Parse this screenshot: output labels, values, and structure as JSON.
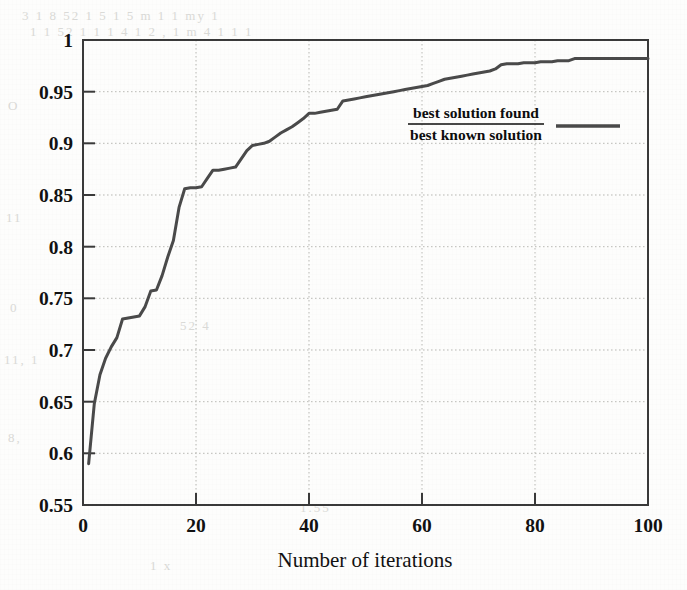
{
  "chart_data": {
    "type": "line",
    "title": "",
    "subtitle": "",
    "xlabel": "Number of iterations",
    "ylabel": "",
    "xlim": [
      0,
      100
    ],
    "ylim": [
      0.55,
      1
    ],
    "grid": true,
    "grid_style": "dotted",
    "legend_position": "inside-center-right",
    "xticks": [
      "0",
      "20",
      "40",
      "60",
      "80",
      "100"
    ],
    "xtick_values": [
      0,
      20,
      40,
      60,
      80,
      100
    ],
    "yticks": [
      "0.55",
      "0.6",
      "0.65",
      "0.7",
      "0.75",
      "0.8",
      "0.85",
      "0.9",
      "0.95",
      "1"
    ],
    "ytick_values": [
      0.55,
      0.6,
      0.65,
      0.7,
      0.75,
      0.8,
      0.85,
      0.9,
      0.95,
      1
    ],
    "series": [
      {
        "name": "best solution found / best known solution",
        "legend_numerator": "best solution found",
        "legend_denominator": "best known solution",
        "color": "#4a4a4a",
        "line_width": 3,
        "x": [
          1,
          2,
          3,
          4,
          5,
          6,
          7,
          8,
          9,
          10,
          11,
          12,
          13,
          14,
          15,
          16,
          17,
          18,
          19,
          20,
          21,
          22,
          23,
          24,
          25,
          26,
          27,
          28,
          29,
          30,
          31,
          32,
          33,
          34,
          35,
          36,
          37,
          38,
          39,
          40,
          41,
          42,
          43,
          44,
          45,
          46,
          47,
          48,
          49,
          50,
          51,
          52,
          53,
          54,
          55,
          56,
          57,
          58,
          59,
          60,
          61,
          62,
          63,
          64,
          65,
          66,
          67,
          68,
          69,
          70,
          71,
          72,
          73,
          74,
          75,
          76,
          77,
          78,
          79,
          80,
          81,
          82,
          83,
          84,
          85,
          86,
          87,
          88,
          89,
          90,
          91,
          92,
          93,
          94,
          95,
          96,
          97,
          98,
          99,
          100
        ],
        "y": [
          0.59,
          0.648,
          0.676,
          0.692,
          0.703,
          0.712,
          0.73,
          0.731,
          0.732,
          0.733,
          0.742,
          0.757,
          0.758,
          0.772,
          0.79,
          0.806,
          0.838,
          0.856,
          0.857,
          0.857,
          0.858,
          0.866,
          0.874,
          0.874,
          0.875,
          0.876,
          0.877,
          0.885,
          0.893,
          0.898,
          0.899,
          0.9,
          0.902,
          0.906,
          0.91,
          0.913,
          0.916,
          0.92,
          0.924,
          0.929,
          0.929,
          0.93,
          0.931,
          0.932,
          0.933,
          0.941,
          0.942,
          0.943,
          0.944,
          0.945,
          0.946,
          0.947,
          0.948,
          0.949,
          0.95,
          0.951,
          0.952,
          0.953,
          0.954,
          0.955,
          0.956,
          0.958,
          0.96,
          0.962,
          0.963,
          0.964,
          0.965,
          0.966,
          0.967,
          0.968,
          0.969,
          0.97,
          0.972,
          0.976,
          0.977,
          0.977,
          0.977,
          0.978,
          0.978,
          0.978,
          0.979,
          0.979,
          0.979,
          0.98,
          0.98,
          0.98,
          0.982,
          0.982,
          0.982,
          0.982,
          0.982,
          0.982,
          0.982,
          0.982,
          0.982,
          0.982,
          0.982,
          0.982,
          0.982,
          0.982
        ]
      }
    ],
    "start_value": 0.59,
    "end_value": 0.982
  },
  "ghost_text": {
    "row_top_1": "3 1 8 52   1   5 1 5    m  1          1    my      1",
    "row_top_2": "1 1   52 1  1  1  4 1 2 ,   1   m  4   1      1  1",
    "row_left_1": "O",
    "row_left_2": "11",
    "row_left_3": "0",
    "row_left_4": "11, 1",
    "row_left_5": "8,",
    "row_mid_1": "52     4",
    "row_mid_2": "1.55",
    "row_bottom_1": "1       x"
  }
}
